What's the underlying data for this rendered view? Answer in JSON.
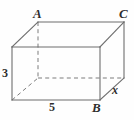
{
  "figure": {
    "type": "rectangular-prism-diagram",
    "projection": "oblique",
    "background_color": "#fefefe",
    "edge_color": "#6d6d6d",
    "hidden_edge_color": "#7d7d7d",
    "label_color": "#2e2e2e",
    "vertex_labels": {
      "A": "A",
      "B": "B",
      "C": "C"
    },
    "dimension_labels": {
      "height": "3",
      "width": "5",
      "depth": "x"
    }
  },
  "geometry": {
    "front_face": {
      "top_left": [
        12,
        47
      ],
      "top_right": [
        100,
        47
      ],
      "bottom_right": [
        100,
        100
      ],
      "bottom_left": [
        12,
        100
      ]
    },
    "back_face": {
      "top_left": [
        38,
        22
      ],
      "top_right": [
        124,
        22
      ],
      "bottom_right": [
        124,
        78
      ],
      "bottom_left": [
        38,
        78
      ]
    },
    "visible_edges": [
      [
        [
          12,
          47
        ],
        [
          100,
          47
        ]
      ],
      [
        [
          100,
          47
        ],
        [
          100,
          100
        ]
      ],
      [
        [
          100,
          100
        ],
        [
          12,
          100
        ]
      ],
      [
        [
          12,
          100
        ],
        [
          12,
          47
        ]
      ],
      [
        [
          12,
          47
        ],
        [
          38,
          22
        ]
      ],
      [
        [
          100,
          47
        ],
        [
          124,
          22
        ]
      ],
      [
        [
          100,
          100
        ],
        [
          124,
          78
        ]
      ],
      [
        [
          38,
          22
        ],
        [
          124,
          22
        ]
      ],
      [
        [
          124,
          22
        ],
        [
          124,
          78
        ]
      ]
    ],
    "hidden_edges": [
      [
        [
          38,
          22
        ],
        [
          38,
          78
        ]
      ],
      [
        [
          38,
          78
        ],
        [
          124,
          78
        ]
      ],
      [
        [
          12,
          100
        ],
        [
          38,
          78
        ]
      ]
    ]
  }
}
